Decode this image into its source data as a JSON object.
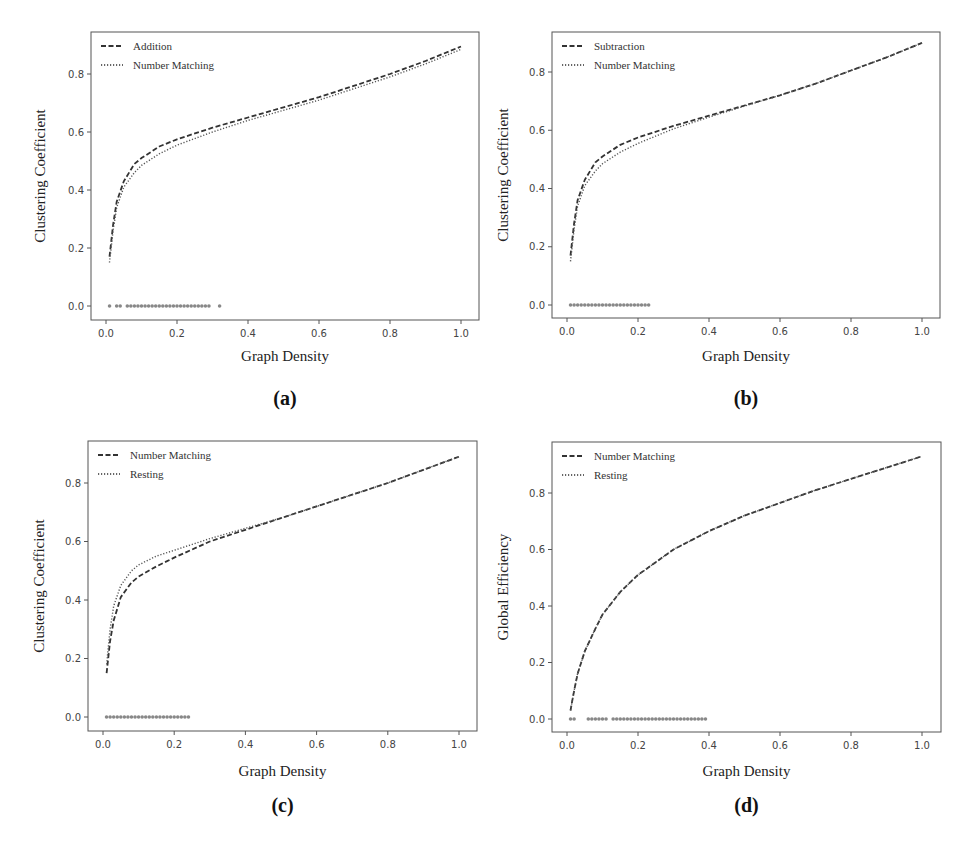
{
  "figure": {
    "background_text": [
      "where v(p) ... the ... of ... ",
      "2.2.5 ...",
      "Result"
    ]
  },
  "chart_data": [
    {
      "id": "a",
      "type": "line",
      "panel_label": "(a)",
      "xlabel": "Graph Density",
      "ylabel": "Clustering Coefficient",
      "xlim": [
        -0.04,
        1.04
      ],
      "ylim": [
        -0.05,
        0.93
      ],
      "xticks": [
        "0.0",
        "0.2",
        "0.4",
        "0.6",
        "0.8",
        "1.0"
      ],
      "yticks": [
        "0.0",
        "0.2",
        "0.4",
        "0.6",
        "0.8"
      ],
      "grid": false,
      "legend_position": "upper left",
      "x": [
        0.01,
        0.02,
        0.03,
        0.05,
        0.08,
        0.1,
        0.15,
        0.2,
        0.3,
        0.4,
        0.5,
        0.6,
        0.7,
        0.8,
        0.9,
        1.0
      ],
      "series": [
        {
          "name": "Addition",
          "style": "dashed",
          "values": [
            0.17,
            0.28,
            0.36,
            0.43,
            0.49,
            0.51,
            0.55,
            0.575,
            0.615,
            0.65,
            0.685,
            0.72,
            0.76,
            0.8,
            0.845,
            0.895
          ]
        },
        {
          "name": "Number Matching",
          "style": "dotted",
          "values": [
            0.15,
            0.26,
            0.34,
            0.41,
            0.46,
            0.485,
            0.525,
            0.555,
            0.6,
            0.64,
            0.675,
            0.71,
            0.75,
            0.79,
            0.835,
            0.885
          ]
        }
      ],
      "significance_markers": {
        "y": 0.0,
        "ranges": [
          [
            0.01,
            0.01
          ],
          [
            0.03,
            0.04
          ],
          [
            0.06,
            0.29
          ],
          [
            0.32,
            0.32
          ]
        ]
      }
    },
    {
      "id": "b",
      "type": "line",
      "panel_label": "(b)",
      "xlabel": "Graph Density",
      "ylabel": "Clustering Coefficient",
      "xlim": [
        -0.04,
        1.04
      ],
      "ylim": [
        -0.05,
        0.93
      ],
      "xticks": [
        "0.0",
        "0.2",
        "0.4",
        "0.6",
        "0.8",
        "1.0"
      ],
      "yticks": [
        "0.0",
        "0.2",
        "0.4",
        "0.6",
        "0.8"
      ],
      "grid": false,
      "legend_position": "upper left",
      "x": [
        0.01,
        0.02,
        0.03,
        0.05,
        0.08,
        0.1,
        0.15,
        0.2,
        0.3,
        0.4,
        0.5,
        0.6,
        0.7,
        0.8,
        0.9,
        1.0
      ],
      "series": [
        {
          "name": "Subtraction",
          "style": "dashed",
          "values": [
            0.17,
            0.28,
            0.36,
            0.43,
            0.49,
            0.51,
            0.55,
            0.575,
            0.615,
            0.65,
            0.685,
            0.72,
            0.76,
            0.805,
            0.85,
            0.9
          ]
        },
        {
          "name": "Number Matching",
          "style": "dotted",
          "values": [
            0.15,
            0.26,
            0.34,
            0.41,
            0.46,
            0.485,
            0.525,
            0.555,
            0.605,
            0.645,
            0.683,
            0.72,
            0.76,
            0.805,
            0.85,
            0.9
          ]
        }
      ],
      "significance_markers": {
        "y": 0.0,
        "ranges": [
          [
            0.01,
            0.23
          ]
        ]
      }
    },
    {
      "id": "c",
      "type": "line",
      "panel_label": "(c)",
      "xlabel": "Graph Density",
      "ylabel": "Clustering Coefficient",
      "xlim": [
        -0.04,
        1.04
      ],
      "ylim": [
        -0.05,
        0.93
      ],
      "xticks": [
        "0.0",
        "0.2",
        "0.4",
        "0.6",
        "0.8",
        "1.0"
      ],
      "yticks": [
        "0.0",
        "0.2",
        "0.4",
        "0.6",
        "0.8"
      ],
      "grid": false,
      "legend_position": "upper left",
      "x": [
        0.01,
        0.02,
        0.03,
        0.05,
        0.08,
        0.1,
        0.15,
        0.2,
        0.3,
        0.4,
        0.5,
        0.6,
        0.7,
        0.8,
        0.9,
        1.0
      ],
      "series": [
        {
          "name": "Number Matching",
          "style": "dashed",
          "values": [
            0.15,
            0.26,
            0.33,
            0.41,
            0.46,
            0.48,
            0.515,
            0.545,
            0.6,
            0.64,
            0.68,
            0.72,
            0.76,
            0.8,
            0.845,
            0.89
          ]
        },
        {
          "name": "Resting",
          "style": "dotted",
          "values": [
            0.18,
            0.3,
            0.38,
            0.45,
            0.5,
            0.52,
            0.55,
            0.57,
            0.61,
            0.645,
            0.68,
            0.72,
            0.76,
            0.8,
            0.845,
            0.89
          ]
        }
      ],
      "significance_markers": {
        "y": 0.0,
        "ranges": [
          [
            0.01,
            0.24
          ]
        ]
      }
    },
    {
      "id": "d",
      "type": "line",
      "panel_label": "(d)",
      "xlabel": "Graph Density",
      "ylabel": "Global Efficiency",
      "xlim": [
        -0.04,
        1.04
      ],
      "ylim": [
        -0.04,
        0.97
      ],
      "xticks": [
        "0.0",
        "0.2",
        "0.4",
        "0.6",
        "0.8",
        "1.0"
      ],
      "yticks": [
        "0.0",
        "0.2",
        "0.4",
        "0.6",
        "0.8"
      ],
      "grid": false,
      "legend_position": "upper left",
      "x": [
        0.01,
        0.02,
        0.03,
        0.05,
        0.08,
        0.1,
        0.15,
        0.2,
        0.3,
        0.4,
        0.5,
        0.6,
        0.7,
        0.8,
        0.9,
        1.0
      ],
      "series": [
        {
          "name": "Number Matching",
          "style": "dashed",
          "values": [
            0.03,
            0.1,
            0.16,
            0.24,
            0.32,
            0.37,
            0.45,
            0.51,
            0.6,
            0.665,
            0.72,
            0.765,
            0.81,
            0.85,
            0.89,
            0.93
          ]
        },
        {
          "name": "Resting",
          "style": "dotted",
          "values": [
            0.03,
            0.1,
            0.16,
            0.24,
            0.32,
            0.37,
            0.45,
            0.51,
            0.6,
            0.665,
            0.72,
            0.765,
            0.81,
            0.85,
            0.89,
            0.93
          ]
        }
      ],
      "significance_markers": {
        "y": 0.0,
        "ranges": [
          [
            0.01,
            0.02
          ],
          [
            0.06,
            0.11
          ],
          [
            0.13,
            0.39
          ]
        ]
      }
    }
  ],
  "layout": {
    "panels": [
      {
        "frame": [
          91,
          32,
          479,
          320
        ],
        "x0": 106,
        "x1": 461,
        "y0": 306,
        "y08": 74,
        "xlabel_y": 361,
        "panel_label_y": 405,
        "ylabel_x": 45
      },
      {
        "frame": [
          552,
          32,
          940,
          318
        ],
        "x0": 567,
        "x1": 922,
        "y0": 305,
        "y08": 72,
        "xlabel_y": 361,
        "panel_label_y": 405,
        "ylabel_x": 508
      },
      {
        "frame": [
          88,
          441,
          477,
          731
        ],
        "x0": 103,
        "x1": 459,
        "y0": 717,
        "y08": 483,
        "xlabel_y": 776,
        "panel_label_y": 812,
        "ylabel_x": 44
      },
      {
        "frame": [
          552,
          442,
          941,
          732
        ],
        "x0": 567,
        "x1": 922,
        "y0": 719,
        "y08": 493,
        "xlabel_y": 776,
        "panel_label_y": 812,
        "ylabel_x": 508
      }
    ]
  }
}
